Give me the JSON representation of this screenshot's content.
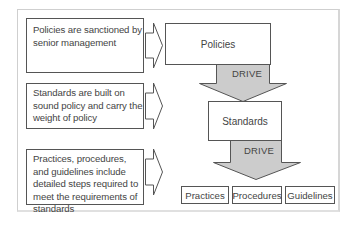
{
  "diagram": {
    "descriptions": [
      {
        "text": "Policies are sanctioned by senior management"
      },
      {
        "text": "Standards are built on sound policy and carry the weight of policy"
      },
      {
        "text": "Practices, procedures, and guidelines include detailed steps required to meet the requirements of standards"
      }
    ],
    "policies_label": "Policies",
    "standards_label": "Standards",
    "drive_label_1": "DRIVE",
    "drive_label_2": "DRIVE",
    "bottom": [
      {
        "label": "Practices"
      },
      {
        "label": "Procedures"
      },
      {
        "label": "Guidelines"
      }
    ],
    "colors": {
      "arrow_fill": "#cccccc",
      "border": "#555555"
    }
  }
}
